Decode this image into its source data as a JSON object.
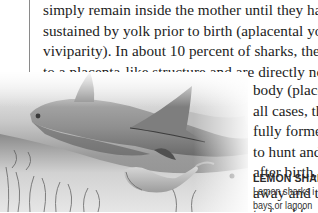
{
  "page": {
    "body_lines": [
      "simply remain inside the mother until they hatch,",
      "sustained by yolk prior to birth (aplacental yolk sac",
      "viviparity). In about 10 percent of sharks, the young",
      "to a placenta-like structure and are directly nourish"
    ],
    "wrap_lines": [
      "body (place",
      "all cases, th",
      "fully forme",
      "to hunt and",
      "after birth,",
      "away and th",
      "to fend for"
    ],
    "caption": {
      "title": "LEMON SHAR",
      "lines": [
        "Lemon sharks i",
        "bays or lagoon",
        "emerge tail fir"
      ]
    },
    "photo": {
      "subject": "lemon shark giving birth over seagrass",
      "tone": "grayscale"
    },
    "colors": {
      "text": "#1c1c1c",
      "rule": "#8a8a8a",
      "background": "#ffffff"
    }
  }
}
